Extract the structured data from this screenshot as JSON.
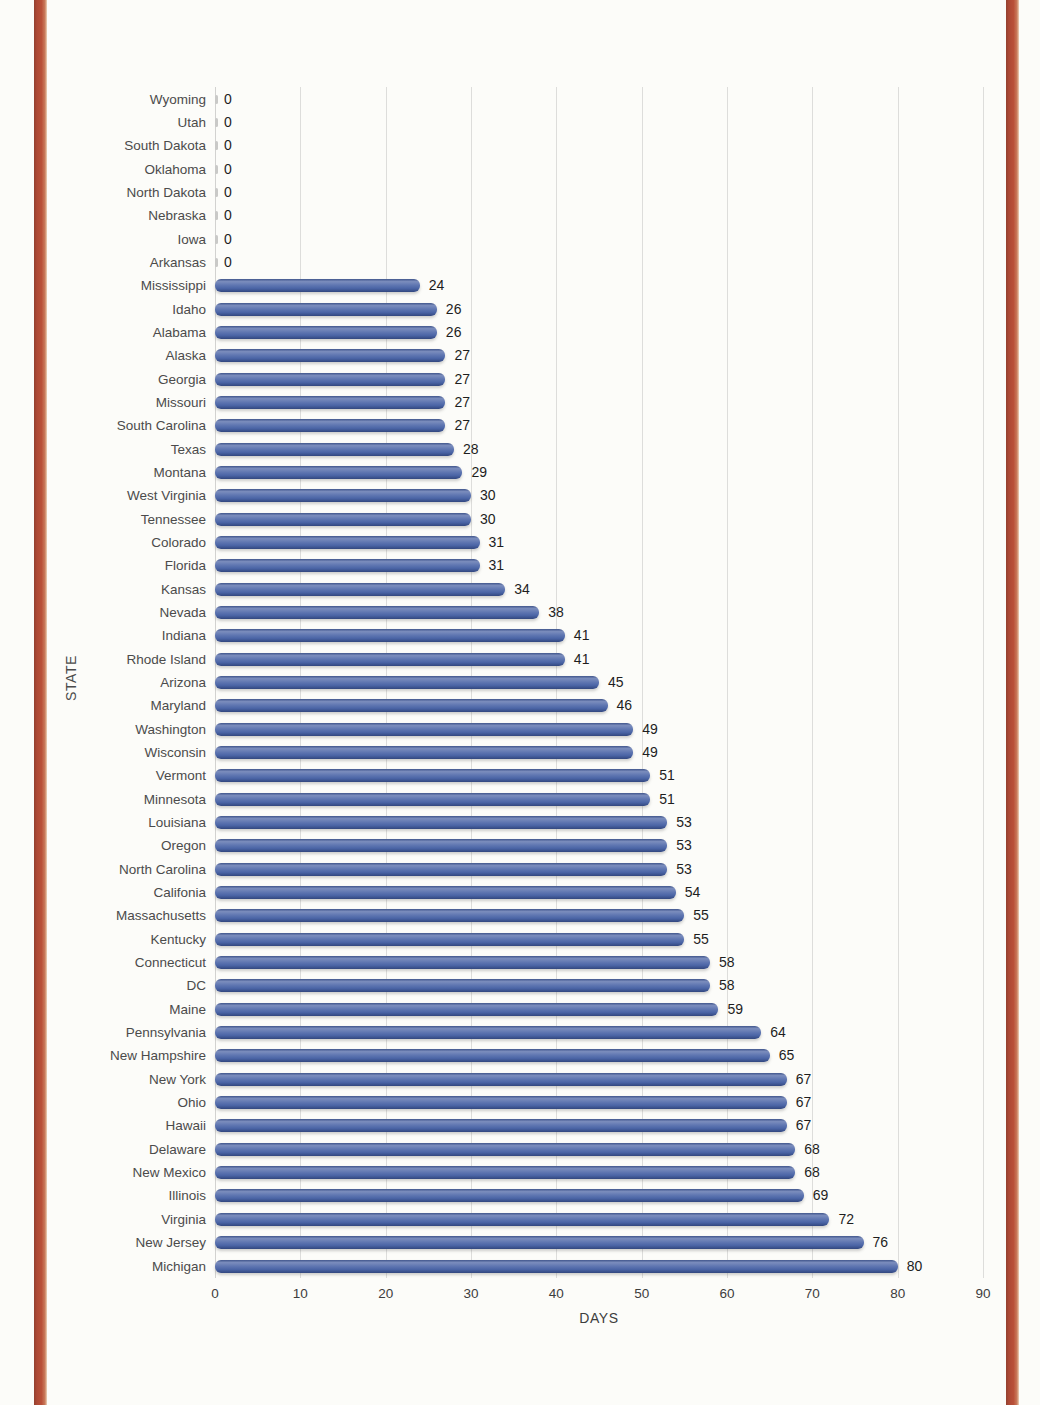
{
  "page": {
    "background": "#fcfcf9",
    "border_stripe_color": "#b95139"
  },
  "chart_data": {
    "type": "bar",
    "orientation": "horizontal",
    "title": "",
    "xlabel": "DAYS",
    "ylabel": "STATE",
    "xlim": [
      0,
      90
    ],
    "xticks": [
      0,
      10,
      20,
      30,
      40,
      50,
      60,
      70,
      80,
      90
    ],
    "grid": true,
    "legend": false,
    "bar_color": "#4b65a6",
    "value_labels": true,
    "categories": [
      "Wyoming",
      "Utah",
      "South Dakota",
      "Oklahoma",
      "North Dakota",
      "Nebraska",
      "Iowa",
      "Arkansas",
      "Mississippi",
      "Idaho",
      "Alabama",
      "Alaska",
      "Georgia",
      "Missouri",
      "South Carolina",
      "Texas",
      "Montana",
      "West Virginia",
      "Tennessee",
      "Colorado",
      "Florida",
      "Kansas",
      "Nevada",
      "Indiana",
      "Rhode Island",
      "Arizona",
      "Maryland",
      "Washington",
      "Wisconsin",
      "Vermont",
      "Minnesota",
      "Louisiana",
      "Oregon",
      "North Carolina",
      "Califonia",
      "Massachusetts",
      "Kentucky",
      "Connecticut",
      "DC",
      "Maine",
      "Pennsylvania",
      "New Hampshire",
      "New York",
      "Ohio",
      "Hawaii",
      "Delaware",
      "New Mexico",
      "Illinois",
      "Virginia",
      "New Jersey",
      "Michigan"
    ],
    "values": [
      0,
      0,
      0,
      0,
      0,
      0,
      0,
      0,
      24,
      26,
      26,
      27,
      27,
      27,
      27,
      28,
      29,
      30,
      30,
      31,
      31,
      34,
      38,
      41,
      41,
      45,
      46,
      49,
      49,
      51,
      51,
      53,
      53,
      53,
      54,
      55,
      55,
      58,
      58,
      59,
      64,
      65,
      67,
      67,
      67,
      68,
      68,
      69,
      72,
      76,
      80
    ]
  }
}
